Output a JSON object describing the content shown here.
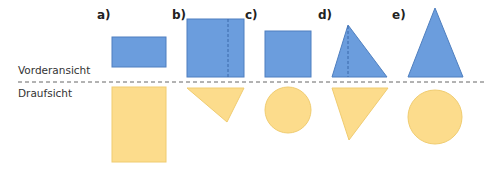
{
  "colors": {
    "front_fill": "#6b9ddd",
    "front_stroke": "#4f7fbf",
    "top_fill": "#fcdc8c",
    "top_stroke": "#f0cc70",
    "divider": "#666666",
    "hidden_edge": "#3a68aa"
  },
  "row_labels": {
    "front": "Vorderansicht",
    "top": "Draufsicht"
  },
  "parts": [
    {
      "id": "a",
      "label": "a)",
      "front_view": "rectangle",
      "top_view": "rectangle"
    },
    {
      "id": "b",
      "label": "b)",
      "front_view": "square-with-hidden-edge",
      "top_view": "inverted-triangle"
    },
    {
      "id": "c",
      "label": "c)",
      "front_view": "square",
      "top_view": "circle"
    },
    {
      "id": "d",
      "label": "d)",
      "front_view": "right-triangle-with-hidden-edge",
      "top_view": "inverted-triangle"
    },
    {
      "id": "e",
      "label": "e)",
      "front_view": "isosceles-triangle",
      "top_view": "circle"
    }
  ]
}
